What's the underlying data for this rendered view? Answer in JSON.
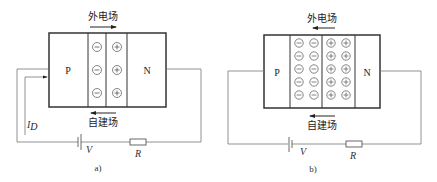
{
  "figure": {
    "panels": [
      {
        "id": "a",
        "caption": "a)",
        "p_label": "P",
        "n_label": "N",
        "external_field_label": "外电场",
        "external_field_direction": "right",
        "built_in_field_label": "自建场",
        "built_in_field_direction": "left",
        "depletion_columns_per_side": 1,
        "charge_rows": 3,
        "negative_symbol": "−",
        "positive_symbol": "+",
        "current_label": "I",
        "current_subscript": "D",
        "battery_label": "V",
        "resistor_label": "R"
      },
      {
        "id": "b",
        "caption": "b)",
        "p_label": "P",
        "n_label": "N",
        "external_field_label": "外电场",
        "external_field_direction": "left",
        "built_in_field_label": "自建场",
        "built_in_field_direction": "left",
        "depletion_columns_per_side": 2,
        "charge_rows": 5,
        "negative_symbol": "−",
        "positive_symbol": "+",
        "battery_label": "V",
        "resistor_label": "R"
      }
    ]
  },
  "colors": {
    "line": "#333333",
    "wire": "#777777",
    "charge_circle": "#666666"
  }
}
